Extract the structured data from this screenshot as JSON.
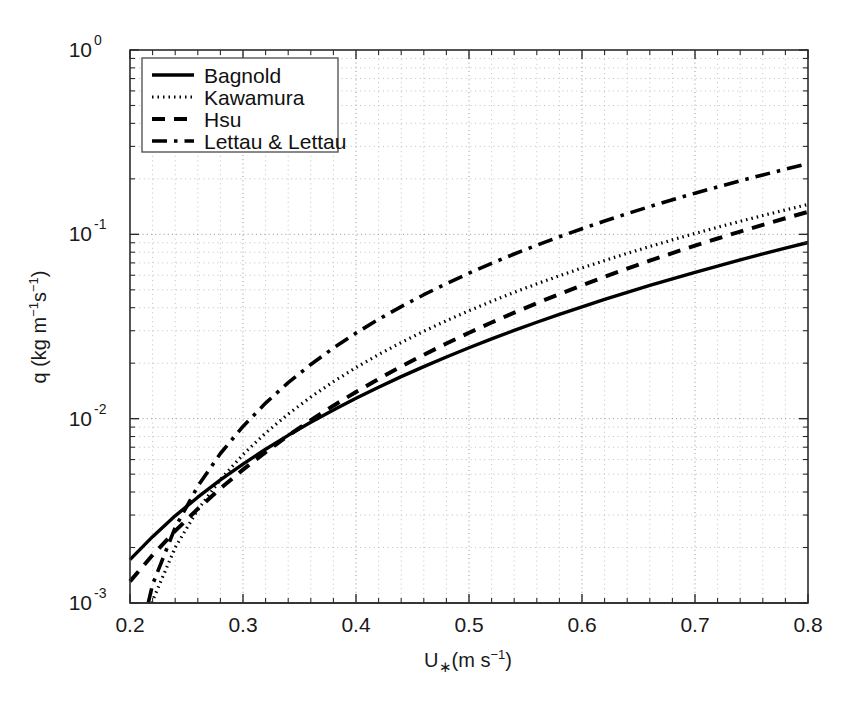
{
  "chart_data": {
    "type": "line",
    "title": "",
    "xlabel": "U∗(m s⁻¹)",
    "ylabel": "q (kg m⁻¹s⁻¹)",
    "xscale": "linear",
    "yscale": "log",
    "xlim": [
      0.2,
      0.8
    ],
    "ylim": [
      0.001,
      1.0
    ],
    "xticks": [
      0.2,
      0.3,
      0.4,
      0.5,
      0.6,
      0.7,
      0.8
    ],
    "xticklabels": [
      "0.2",
      "0.3",
      "0.4",
      "0.5",
      "0.6",
      "0.7",
      "0.8"
    ],
    "yticks": [
      0.001,
      0.01,
      0.1,
      1.0
    ],
    "yticklabels": [
      "10",
      "10",
      "10",
      "10"
    ],
    "yticklabel_exponents": [
      "-3",
      "-2",
      "-1",
      "0"
    ],
    "grid": "both-minor-and-major-dotted",
    "legend_position": "upper-left-inside",
    "x": [
      0.2,
      0.22,
      0.24,
      0.26,
      0.28,
      0.3,
      0.32,
      0.34,
      0.36,
      0.38,
      0.4,
      0.42,
      0.44,
      0.46,
      0.48,
      0.5,
      0.52,
      0.54,
      0.56,
      0.58,
      0.6,
      0.62,
      0.64,
      0.66,
      0.68,
      0.7,
      0.72,
      0.74,
      0.76,
      0.78,
      0.8
    ],
    "series": [
      {
        "name": "Bagnold",
        "style": "solid",
        "values": [
          0.00172,
          0.00229,
          0.00297,
          0.00375,
          0.00465,
          0.00567,
          0.00683,
          0.00812,
          0.00956,
          0.01115,
          0.0129,
          0.01481,
          0.0169,
          0.01916,
          0.02161,
          0.02424,
          0.02707,
          0.0301,
          0.03334,
          0.03678,
          0.04045,
          0.04433,
          0.04845,
          0.0528,
          0.05739,
          0.06222,
          0.06731,
          0.07266,
          0.07827,
          0.08414,
          0.0903
        ]
      },
      {
        "name": "Kawamura",
        "style": "dotted",
        "values": [
          0.00032,
          0.00103,
          0.002,
          0.00321,
          0.00467,
          0.00639,
          0.00836,
          0.0106,
          0.0131,
          0.01588,
          0.01893,
          0.02227,
          0.02589,
          0.0298,
          0.034,
          0.03851,
          0.04332,
          0.04844,
          0.05387,
          0.05962,
          0.0657,
          0.0721,
          0.07884,
          0.08591,
          0.09332,
          0.10108,
          0.10919,
          0.11765,
          0.12647,
          0.13565,
          0.1452
        ]
      },
      {
        "name": "Hsu",
        "style": "dashed",
        "values": [
          0.00131,
          0.00182,
          0.00246,
          0.00324,
          0.00418,
          0.00529,
          0.00659,
          0.00809,
          0.00981,
          0.01176,
          0.01396,
          0.01643,
          0.01917,
          0.02221,
          0.02556,
          0.02923,
          0.03324,
          0.0376,
          0.04233,
          0.04743,
          0.05293,
          0.05884,
          0.06516,
          0.07192,
          0.07912,
          0.08678,
          0.09491,
          0.10353,
          0.11264,
          0.12226,
          0.1324
        ]
      },
      {
        "name": "Lettau & Lettau",
        "style": "dashdot",
        "values": [
          0.00038,
          0.00126,
          0.00257,
          0.0043,
          0.00647,
          0.00908,
          0.01215,
          0.01568,
          0.01968,
          0.02416,
          0.02912,
          0.03459,
          0.04055,
          0.04703,
          0.05403,
          0.06155,
          0.06961,
          0.0782,
          0.08734,
          0.09703,
          0.10728,
          0.11809,
          0.12947,
          0.14143,
          0.15396,
          0.16708,
          0.18079,
          0.19509,
          0.21,
          0.2255,
          0.24162
        ]
      }
    ],
    "legend": [
      {
        "label": "Bagnold",
        "style": "solid"
      },
      {
        "label": "Kawamura",
        "style": "dotted"
      },
      {
        "label": "Hsu",
        "style": "dashed"
      },
      {
        "label": "Lettau & Lettau",
        "style": "dashdot"
      }
    ],
    "axis_label_parts": {
      "y_prefix": "q (kg m",
      "y_sup1": "−1",
      "y_mid": "s",
      "y_sup2": "−1",
      "y_suffix": ")",
      "x_main": "U",
      "x_sub": "∗",
      "x_rest": "(m s",
      "x_sup": "−1",
      "x_close": ")"
    },
    "colors": {
      "curve": "#000000",
      "axis": "#2b2b2b",
      "grid_major": "#8a8a8a",
      "grid_minor": "#b0b0b0",
      "background": "#ffffff",
      "legend_border": "#4a4a4a"
    }
  }
}
